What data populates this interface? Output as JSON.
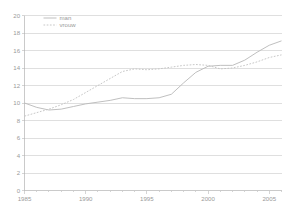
{
  "chart_data": {
    "type": "line",
    "title": "",
    "subtitle": "",
    "xlabel": "",
    "ylabel": "",
    "xlim": [
      1985,
      2006
    ],
    "ylim": [
      0,
      20
    ],
    "ytick_step": 2,
    "xtick_step": 1,
    "grid": true,
    "grid_orientation": "horizontal",
    "legend_position": "top-left-inside",
    "x": [
      1985,
      1986,
      1987,
      1988,
      1989,
      1990,
      1991,
      1992,
      1993,
      1994,
      1995,
      1996,
      1997,
      1998,
      1999,
      2000,
      2001,
      2002,
      2003,
      2004,
      2005,
      2006
    ],
    "xticklabels": [
      "1985",
      "1990",
      "1995",
      "2000",
      "2005"
    ],
    "xticklabel_values": [
      1985,
      1990,
      1995,
      2000,
      2005
    ],
    "yticklabels": [
      "0",
      "2",
      "4",
      "6",
      "8",
      "10",
      "12",
      "14",
      "16",
      "18",
      "20"
    ],
    "yticklabel_values": [
      0,
      2,
      4,
      6,
      8,
      10,
      12,
      14,
      16,
      18,
      20
    ],
    "series": [
      {
        "name": "man",
        "style": "solid",
        "color": "#bcbcbc",
        "values": [
          10.0,
          9.5,
          9.2,
          9.3,
          9.6,
          9.9,
          10.1,
          10.3,
          10.6,
          10.5,
          10.5,
          10.6,
          11.0,
          12.3,
          13.5,
          14.2,
          14.3,
          14.3,
          14.9,
          15.8,
          16.6,
          17.1
        ]
      },
      {
        "name": "vrouw",
        "style": "dotted",
        "color": "#c4c4c4",
        "values": [
          8.5,
          8.9,
          9.3,
          9.8,
          10.4,
          11.2,
          12.0,
          12.8,
          13.6,
          13.9,
          13.8,
          13.9,
          14.1,
          14.3,
          14.4,
          14.3,
          13.9,
          14.0,
          14.3,
          14.7,
          15.2,
          15.5
        ]
      }
    ]
  },
  "legend": {
    "entries": [
      {
        "label": "man"
      },
      {
        "label": "vrouw"
      }
    ]
  },
  "colors": {
    "background": "#ffffff",
    "gridline": "#c9c9c9",
    "axis": "#b4b4b4",
    "tick_text": "#9a9a9a",
    "series_man": "#bcbcbc",
    "series_vrouw": "#c4c4c4"
  }
}
